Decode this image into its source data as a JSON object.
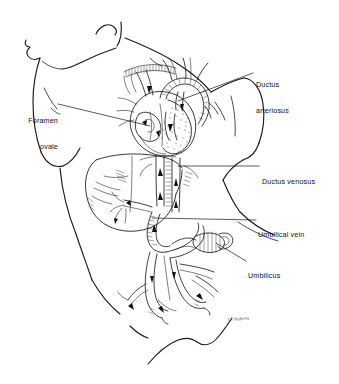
{
  "figure": {
    "background_color": "#ffffff",
    "ink_color": "#1a1a1a",
    "signature": "C. Roberts"
  },
  "labels": [
    {
      "id": "foramen-ovale",
      "line1": "Foramen",
      "line2": "ovale",
      "align": "right",
      "structure": "foramen ovale"
    },
    {
      "id": "ductus-arteriosus",
      "line1": "Ductus",
      "line2": "arteriosus",
      "align": "left",
      "structure": "ductus arteriosus"
    },
    {
      "id": "ductus-venosus",
      "line1": "Ductus venosus",
      "line2": "",
      "align": "left",
      "structure": "ductus venosus"
    },
    {
      "id": "umbilical-vein",
      "line1": "Umbilical vein",
      "line2": "",
      "align": "left",
      "structure": "umbilical vein"
    },
    {
      "id": "umbilicus",
      "line1": "Umbilicus",
      "line2": "",
      "align": "left",
      "structure": "umbilicus"
    }
  ],
  "anatomy": {
    "parts": [
      "chin",
      "neck",
      "left-shoulder",
      "right-shoulder",
      "left-arm",
      "right-arm",
      "torso",
      "hip",
      "heart",
      "aortic-arch",
      "pulmonary-artery",
      "superior-vena-cava",
      "inferior-vena-cava",
      "liver",
      "ductus-venosus",
      "umbilical-vein",
      "umbilical-cord",
      "umbilical-arteries",
      "cord-clamp"
    ]
  }
}
